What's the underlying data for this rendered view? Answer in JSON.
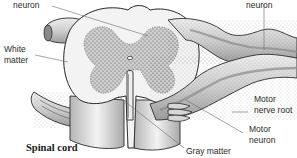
{
  "diagram": {
    "title": "Spinal cord",
    "labels": {
      "sensory_neuron_left": "neuron",
      "sensory_neuron_right": "neuron",
      "white_matter_line1": "White",
      "white_matter_line2": "matter",
      "motor_nerve_root_line1": "Motor",
      "motor_nerve_root_line2": "nerve root",
      "motor_neuron_line1": "Motor",
      "motor_neuron_line2": "neuron",
      "gray_matter": "Gray matter"
    },
    "colors": {
      "outline": "#2b2b2b",
      "white_matter": "#f2f2f2",
      "gray_matter": "#c9c9c9",
      "nerve_fill": "#d8d8d8",
      "nerve_shade": "#9a9a9a",
      "stipple": "#555555",
      "leader_line": "#6a6a6a"
    }
  }
}
